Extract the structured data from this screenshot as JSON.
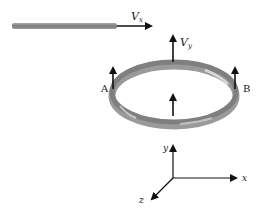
{
  "diagram": {
    "rod": {
      "label": "rod"
    },
    "velocity_x": {
      "symbol": "V",
      "subscript": "x"
    },
    "velocity_y": {
      "symbol": "V",
      "subscript": "y"
    },
    "ring": {
      "label_left": "A",
      "label_right": "B"
    },
    "axes": {
      "x_label": "x",
      "y_label": "y",
      "z_label": "z"
    },
    "colors": {
      "rod": "#8a8a8a",
      "ring": "#8c8c8c",
      "arrow": "#111111",
      "text": "#222222"
    }
  }
}
